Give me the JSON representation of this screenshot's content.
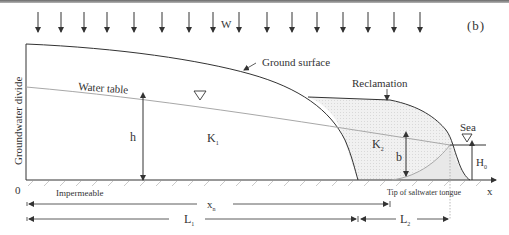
{
  "figure": {
    "panel_label": "(b)",
    "recharge_label": "W",
    "labels": {
      "ground_surface": "Ground surface",
      "water_table": "Water table",
      "reclamation": "Reclamation",
      "sea": "Sea",
      "groundwater_divide": "Groundwater divide",
      "impermeable": "Impermeable",
      "tip_saltwater": "Tip of saltwater tongue",
      "origin": "0",
      "x_axis": "x",
      "h": "h",
      "b": "b",
      "H0_main": "H",
      "H0_sub": "0",
      "K1_main": "K",
      "K1_sub": "1",
      "K2_main": "K",
      "K2_sub": "2",
      "xn_main": "x",
      "xn_sub": "n",
      "L1_main": "L",
      "L1_sub": "1",
      "L2_main": "L",
      "L2_sub": "2"
    },
    "colors": {
      "line": "#333333",
      "water_table": "#a8a8a8",
      "reclamation_fill": "#eeeeee",
      "hatch": "#bdbdbd"
    }
  }
}
